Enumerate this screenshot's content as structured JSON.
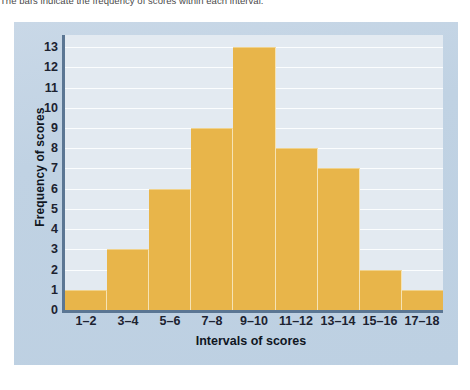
{
  "caption": {
    "text": "The bars indicate the frequency of scores within each interval."
  },
  "colors": {
    "bar_fill": "#E8B54A",
    "plot_background": "#E3EAF1",
    "panel_background": "#C3D4E4",
    "axis_line": "#5B7693",
    "gridline": "#FBFDFE",
    "text": "#1C2230"
  },
  "chart_data": {
    "type": "bar",
    "title": "",
    "subtitle": "",
    "categories": [
      "1–2",
      "3–4",
      "5–6",
      "7–8",
      "9–10",
      "11–12",
      "13–14",
      "15–16",
      "17–18"
    ],
    "values": [
      1,
      3,
      6,
      9,
      13,
      8,
      7,
      2,
      1
    ],
    "xlabel": "Intervals of scores",
    "ylabel": "Frequency of scores",
    "ylim": [
      0,
      13.6
    ],
    "yticks": [
      0,
      1,
      2,
      3,
      4,
      5,
      6,
      7,
      8,
      9,
      10,
      11,
      12,
      13
    ],
    "ytick_labels": [
      "0",
      "1",
      "2",
      "3",
      "4",
      "5",
      "6",
      "7",
      "8",
      "9",
      "10",
      "11",
      "12",
      "13"
    ],
    "grid": true,
    "grid_axis": "y",
    "legend": false,
    "legend_position": "none"
  }
}
